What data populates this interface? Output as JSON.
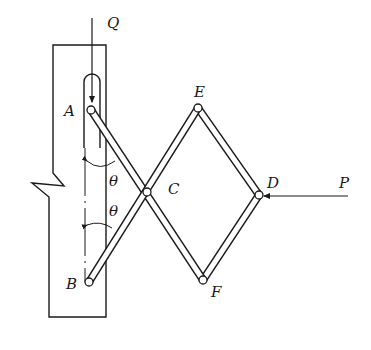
{
  "diagram": {
    "type": "scissor-linkage mechanism",
    "labels": {
      "Q": "Q",
      "P": "P",
      "A": "A",
      "B": "B",
      "C": "C",
      "D": "D",
      "E": "E",
      "F": "F",
      "theta_upper": "θ",
      "theta_lower": "θ"
    },
    "points": {
      "A": [
        91,
        110
      ],
      "B": [
        89,
        282
      ],
      "C": [
        147,
        192
      ],
      "D": [
        259,
        195
      ],
      "E": [
        198,
        108
      ],
      "F": [
        203,
        280
      ]
    },
    "forces": [
      {
        "name": "Q",
        "direction": "down",
        "applied_at": "A"
      },
      {
        "name": "P",
        "direction": "left",
        "applied_at": "D"
      }
    ],
    "colors": {
      "ink": "#1a1a1a",
      "background": "#ffffff"
    }
  }
}
